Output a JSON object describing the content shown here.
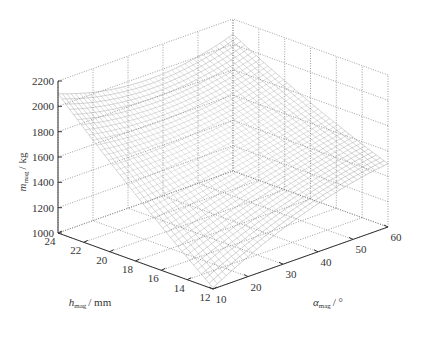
{
  "chart_data": {
    "type": "surface3d",
    "title": "",
    "x_axis": {
      "name": "alpha_mag",
      "label_symbol": "α",
      "label_sub": "mag",
      "label_unit": "/ °",
      "range": [
        10,
        60
      ],
      "ticks": [
        "10",
        "20",
        "30",
        "40",
        "50",
        "60"
      ]
    },
    "y_axis": {
      "name": "h_mag",
      "label_symbol": "h",
      "label_sub": "mag",
      "label_unit": "/ mm",
      "range": [
        12,
        24
      ],
      "ticks": [
        "12",
        "14",
        "16",
        "18",
        "20",
        "22",
        "24"
      ]
    },
    "z_axis": {
      "name": "m_mag",
      "label_symbol": "m",
      "label_sub": "mag",
      "label_unit": "/ kg",
      "range": [
        1000,
        2200
      ],
      "ticks": [
        "1000",
        "1200",
        "1400",
        "1600",
        "1800",
        "2000",
        "2200"
      ]
    },
    "grid": true,
    "corner_values": [
      {
        "alpha": 10,
        "h": 24,
        "m": 2100
      },
      {
        "alpha": 10,
        "h": 12,
        "m": 1010
      },
      {
        "alpha": 60,
        "h": 12,
        "m": 1500
      },
      {
        "alpha": 60,
        "h": 24,
        "m": 2080
      }
    ],
    "mesh": {
      "alpha_steps": 40,
      "h_steps": 40,
      "color": "#888888"
    }
  }
}
